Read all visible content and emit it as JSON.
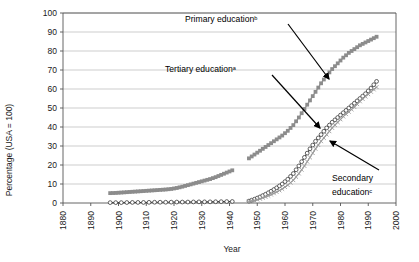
{
  "chart_data": {
    "type": "line",
    "title": "",
    "xlabel": "Year",
    "ylabel": "Percentage (USA = 100)",
    "xlim": [
      1880,
      2000
    ],
    "ylim": [
      0,
      100
    ],
    "xticks": [
      1880,
      1890,
      1900,
      1910,
      1920,
      1930,
      1940,
      1950,
      1960,
      1970,
      1980,
      1990,
      2000
    ],
    "yticks": [
      0,
      10,
      20,
      30,
      40,
      50,
      60,
      70,
      80,
      90,
      100
    ],
    "grid": "horizontal",
    "legend": "none (inline arrow annotations)",
    "series": [
      {
        "name": "Primary education",
        "footnote": "b",
        "marker": "filled-square",
        "color": "#8c8c8c",
        "segments": [
          {
            "label": "early",
            "x": [
              1897,
              1899,
              1901,
              1903,
              1905,
              1907,
              1909,
              1911,
              1913,
              1915,
              1917,
              1919,
              1921,
              1923,
              1925,
              1927,
              1929,
              1931,
              1933,
              1935,
              1937,
              1939,
              1941
            ],
            "y": [
              5.2,
              5.3,
              5.5,
              5.7,
              5.9,
              6.1,
              6.3,
              6.5,
              6.7,
              6.9,
              7.1,
              7.4,
              7.9,
              8.6,
              9.4,
              10.2,
              11.0,
              11.8,
              12.6,
              13.6,
              14.8,
              16.0,
              17.2
            ]
          },
          {
            "label": "late",
            "x": [
              1947,
              1949,
              1951,
              1953,
              1955,
              1957,
              1959,
              1961,
              1963,
              1965,
              1967,
              1969,
              1971,
              1973,
              1975,
              1977,
              1979,
              1981,
              1983,
              1985,
              1987,
              1989,
              1991,
              1993
            ],
            "y": [
              23.5,
              25.5,
              27.5,
              29.5,
              31.5,
              33.5,
              35.5,
              38.0,
              41.0,
              45.0,
              49.5,
              54.0,
              58.5,
              63.0,
              67.0,
              70.5,
              73.5,
              76.5,
              79.0,
              81.0,
              83.0,
              84.5,
              86.0,
              87.5
            ]
          }
        ]
      },
      {
        "name": "Tertiary education",
        "footnote": "a",
        "marker": "open-circle",
        "color": "#3a3a3a",
        "segments": [
          {
            "label": "early",
            "x": [
              1897,
              1901,
              1905,
              1909,
              1913,
              1917,
              1921,
              1925,
              1929,
              1933,
              1937,
              1941
            ],
            "y": [
              0.2,
              0.2,
              0.3,
              0.3,
              0.4,
              0.4,
              0.5,
              0.5,
              0.6,
              0.6,
              0.7,
              0.8
            ]
          },
          {
            "label": "late",
            "x": [
              1947,
              1949,
              1951,
              1953,
              1955,
              1957,
              1959,
              1961,
              1963,
              1965,
              1967,
              1969,
              1971,
              1973,
              1975,
              1977,
              1979,
              1981,
              1983,
              1985,
              1987,
              1989,
              1991,
              1993
            ],
            "y": [
              1.0,
              2.0,
              3.2,
              4.6,
              6.2,
              8.0,
              10.0,
              12.5,
              15.5,
              19.5,
              24.0,
              28.5,
              32.5,
              36.0,
              39.5,
              42.5,
              45.0,
              47.5,
              50.0,
              52.5,
              55.0,
              57.5,
              60.5,
              64.0
            ]
          }
        ]
      },
      {
        "name": "Secondary education",
        "footnote": "c",
        "marker": "x-cross",
        "color": "#9a9a9a",
        "segments": [
          {
            "label": "late",
            "x": [
              1947,
              1949,
              1951,
              1953,
              1955,
              1957,
              1959,
              1961,
              1963,
              1965,
              1967,
              1969,
              1971,
              1973,
              1975,
              1977,
              1979,
              1981,
              1983,
              1985,
              1987,
              1989,
              1991,
              1993
            ],
            "y": [
              0.8,
              1.4,
              2.2,
              3.2,
              4.4,
              5.8,
              7.4,
              9.4,
              12.0,
              15.5,
              19.5,
              24.0,
              28.5,
              32.5,
              36.0,
              39.5,
              42.5,
              45.5,
              48.0,
              50.5,
              53.5,
              56.0,
              58.5,
              61.0
            ]
          }
        ]
      }
    ],
    "annotations": [
      {
        "id": "primary",
        "text": "Primary education",
        "footnote": "b",
        "label_x": 185,
        "label_y": 22,
        "tail_x": 288,
        "tail_y": 24,
        "tip_x": 329,
        "tip_y": 79
      },
      {
        "id": "tertiary",
        "text": "Tertiary education",
        "footnote": "a",
        "label_x": 165,
        "label_y": 72,
        "tail_x": 272,
        "tail_y": 75,
        "tip_x": 320,
        "tip_y": 128
      },
      {
        "id": "secondary",
        "text": "Secondary",
        "text2": "education",
        "footnote": "c",
        "label_x": 332,
        "label_y": 181,
        "label2_y": 195,
        "tail_x": 379,
        "tail_y": 170,
        "tip_x": 330,
        "tip_y": 141
      }
    ]
  },
  "axes": {
    "x_title": "Year",
    "y_title": "Percentage (USA = 100)"
  }
}
